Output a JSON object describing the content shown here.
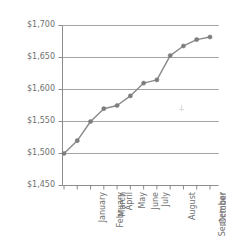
{
  "chart_data": {
    "type": "line",
    "title": "",
    "subtitle": "",
    "xlabel": "",
    "ylabel": "",
    "categories": [
      "January",
      "February",
      "March",
      "April",
      "May",
      "June",
      "July",
      "August",
      "September",
      "October",
      "November",
      "December"
    ],
    "values": [
      1500,
      1520,
      1550,
      1570,
      1575,
      1590,
      1610,
      1615,
      1653,
      1668,
      1678,
      1682
    ],
    "series": [
      {
        "name": "",
        "values": [
          1500,
          1520,
          1550,
          1570,
          1575,
          1590,
          1610,
          1615,
          1653,
          1668,
          1678,
          1682
        ]
      }
    ],
    "ylim": [
      1450,
      1700
    ],
    "ytick_values": [
      1700,
      1650,
      1600,
      1550,
      1500,
      1450
    ],
    "ytick_labels": [
      "$1,700",
      "$1,650",
      "$1,600",
      "$1,550",
      "$1,500",
      "$1,450"
    ],
    "xtick_labels": [
      "January",
      "February",
      "March",
      "April",
      "May",
      "June",
      "July",
      "August",
      "September",
      "October",
      "November",
      "December"
    ],
    "grid": true,
    "grid_axis": "y",
    "legend": false,
    "legend_position": "none",
    "annotations": [],
    "colors": {
      "line": "#8a8a8a",
      "marker": "#7d7d7d",
      "grid": "#9b9b9b",
      "axis": "#8c8c8c",
      "tick_label": "#6f6f6f",
      "background": "#ffffff"
    }
  },
  "axis": {
    "y_tick_labels": [
      "$1,700",
      "$1,650",
      "$1,600",
      "$1,550",
      "$1,500",
      "$1,450"
    ],
    "x_tick_labels": [
      "January",
      "February",
      "March",
      "April",
      "May",
      "June",
      "July",
      "August",
      "September",
      "October",
      "November",
      "December"
    ]
  },
  "artifacts": {
    "cursor_marker_name": "text-cursor-artifact"
  }
}
